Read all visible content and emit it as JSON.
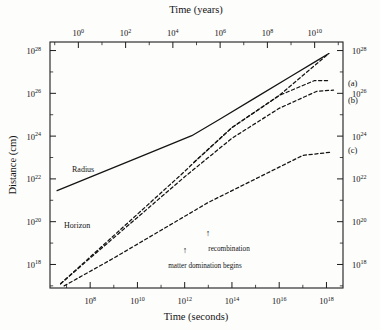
{
  "chart": {
    "type": "line",
    "title": "",
    "axes": {
      "bottom": {
        "label": "Time (seconds)",
        "ticks": [
          "8",
          "10",
          "12",
          "14",
          "16",
          "18"
        ],
        "base": "10",
        "range_exp": [
          6.3,
          18.7
        ]
      },
      "top": {
        "label": "Time (years)",
        "ticks": [
          "0",
          "2",
          "4",
          "6",
          "8",
          "10"
        ],
        "base": "10",
        "range_exp": [
          -1.2,
          11.2
        ]
      },
      "left": {
        "label": "Distance (cm)",
        "ticks": [
          "18",
          "20",
          "22",
          "24",
          "26",
          "28"
        ],
        "base": "10",
        "range_exp": [
          16.9,
          28.4
        ]
      },
      "right": {
        "label": "",
        "ticks": [
          "18",
          "20",
          "22",
          "24",
          "26",
          "28"
        ],
        "base": "10"
      }
    },
    "inline_labels": [
      {
        "name": "radius-label",
        "text": "Radius"
      },
      {
        "name": "horizon-label",
        "text": "Horizon"
      }
    ],
    "curve_labels": [
      {
        "name": "curve-a-label",
        "text": "(a)"
      },
      {
        "name": "curve-b-label",
        "text": "(b)"
      },
      {
        "name": "curve-c-label",
        "text": "(c)"
      }
    ],
    "annotations": [
      {
        "name": "matter-domination-annotation",
        "text": "matter domination begins",
        "arrow": "↑"
      },
      {
        "name": "recombination-annotation",
        "text": "recombination",
        "arrow": "↑"
      }
    ],
    "colors": {
      "ink": "#141414",
      "background": "#fdfdfc"
    }
  },
  "chart_data": {
    "type": "line",
    "title": "",
    "xlabel": "Time (seconds)",
    "ylabel": "Distance (cm)",
    "xlabel_secondary": "Time (years)",
    "x_scale": "log10",
    "y_scale": "log10",
    "xlim": [
      6.3,
      18.7
    ],
    "ylim": [
      16.9,
      28.4
    ],
    "xticks": [
      8,
      10,
      12,
      14,
      16,
      18
    ],
    "yticks": [
      18,
      20,
      22,
      24,
      26,
      28
    ],
    "xticks_top_years": [
      0,
      2,
      4,
      6,
      8,
      10
    ],
    "grid": false,
    "legend": "inline labels",
    "series": [
      {
        "name": "Radius",
        "style": "solid",
        "x_log10": [
          6.6,
          8.0,
          10.0,
          11.5,
          12.3,
          13.5,
          15.0,
          16.5,
          17.6,
          18.1
        ],
        "y_log10": [
          21.45,
          22.08,
          22.98,
          23.66,
          24.02,
          24.8,
          25.8,
          26.8,
          27.53,
          27.86
        ]
      },
      {
        "name": "Horizon",
        "style": "dashed",
        "x_log10": [
          6.75,
          8.0,
          10.0,
          12.0,
          12.4,
          14.0,
          16.0,
          17.5,
          18.1
        ],
        "y_log10": [
          17.1,
          18.35,
          20.35,
          22.35,
          22.78,
          24.4,
          25.9,
          27.3,
          27.86
        ]
      },
      {
        "name": "(a)",
        "style": "dashed",
        "x_log10": [
          12.4,
          14.0,
          16.0,
          17.5,
          18.1
        ],
        "y_log10": [
          22.78,
          24.4,
          25.9,
          26.6,
          26.6
        ]
      },
      {
        "name": "(b)",
        "style": "dashed",
        "x_log10": [
          6.75,
          8.0,
          10.0,
          12.0,
          14.0,
          16.0,
          17.6,
          18.3
        ],
        "y_log10": [
          17.1,
          18.3,
          20.2,
          22.1,
          23.9,
          25.3,
          26.1,
          26.15
        ]
      },
      {
        "name": "(c)",
        "style": "dashed",
        "x_log10": [
          6.9,
          9.0,
          11.0,
          13.0,
          15.0,
          17.0,
          18.2
        ],
        "y_log10": [
          17.0,
          18.3,
          19.6,
          20.9,
          22.0,
          23.1,
          23.25
        ]
      }
    ],
    "annotations": [
      {
        "text": "matter domination begins",
        "arrow_x_log10": 12.3,
        "arrow_y_log10": 18.4
      },
      {
        "text": "recombination",
        "arrow_x_log10": 13.4,
        "arrow_y_log10": 19.3
      }
    ]
  }
}
